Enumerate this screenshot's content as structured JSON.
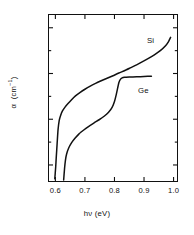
{
  "figure": {
    "width": 194,
    "height": 235,
    "background": "#ffffff",
    "ink_color": "#111111"
  },
  "chart_data": {
    "type": "line",
    "title": "",
    "subtitle": "",
    "xlabel": "hν (eV)",
    "ylabel": "α  (cm⁻¹)",
    "xscale": "linear",
    "yscale": "log",
    "xlim": [
      0.575,
      1.015
    ],
    "ylim": [
      0.18,
      4000000
    ],
    "grid": false,
    "legend_position": "inline-annotations",
    "xticks": [
      0.6,
      0.7,
      0.8,
      0.9,
      1.0
    ],
    "xticklabels": [
      "0.6",
      "0.7",
      "0.8",
      "0.9",
      "1.0"
    ],
    "yticks": [
      1,
      100,
      10000,
      1000000
    ],
    "yticklabels": [
      "1.0",
      "10²",
      "10⁴",
      "10⁶"
    ],
    "ytick_label_parts": [
      {
        "mantissa": "1.0",
        "exponent": ""
      },
      {
        "mantissa": "10",
        "exponent": "2"
      },
      {
        "mantissa": "10",
        "exponent": "4"
      },
      {
        "mantissa": "10",
        "exponent": "6"
      }
    ],
    "yminorticks": [
      10,
      1000,
      100000
    ],
    "series": [
      {
        "name": "Si",
        "label": "Si",
        "color": "#111111",
        "points": [
          [
            0.598,
            0.25
          ],
          [
            0.601,
            0.8
          ],
          [
            0.603,
            2.2
          ],
          [
            0.606,
            9
          ],
          [
            0.609,
            35
          ],
          [
            0.613,
            90
          ],
          [
            0.618,
            150
          ],
          [
            0.624,
            230
          ],
          [
            0.632,
            330
          ],
          [
            0.642,
            470
          ],
          [
            0.654,
            700
          ],
          [
            0.668,
            1050
          ],
          [
            0.684,
            1500
          ],
          [
            0.7,
            2050
          ],
          [
            0.718,
            2800
          ],
          [
            0.736,
            3700
          ],
          [
            0.755,
            4800
          ],
          [
            0.775,
            6200
          ],
          [
            0.795,
            8000
          ],
          [
            0.815,
            10500
          ],
          [
            0.835,
            13500
          ],
          [
            0.855,
            18000
          ],
          [
            0.875,
            24000
          ],
          [
            0.895,
            33000
          ],
          [
            0.915,
            46000
          ],
          [
            0.935,
            66000
          ],
          [
            0.955,
            100000
          ],
          [
            0.972,
            160000
          ],
          [
            0.983,
            250000
          ],
          [
            0.99,
            380000
          ]
        ]
      },
      {
        "name": "Ge",
        "label": "Ge",
        "color": "#111111",
        "points": [
          [
            0.628,
            0.22
          ],
          [
            0.631,
            0.7
          ],
          [
            0.634,
            1.6
          ],
          [
            0.638,
            3.0
          ],
          [
            0.645,
            5.5
          ],
          [
            0.655,
            9.5
          ],
          [
            0.667,
            15
          ],
          [
            0.68,
            23
          ],
          [
            0.695,
            33
          ],
          [
            0.712,
            48
          ],
          [
            0.73,
            68
          ],
          [
            0.748,
            95
          ],
          [
            0.765,
            135
          ],
          [
            0.78,
            200
          ],
          [
            0.792,
            330
          ],
          [
            0.8,
            600
          ],
          [
            0.806,
            1200
          ],
          [
            0.811,
            2400
          ],
          [
            0.815,
            4000
          ],
          [
            0.82,
            5500
          ],
          [
            0.826,
            6400
          ],
          [
            0.834,
            6800
          ],
          [
            0.85,
            7000
          ],
          [
            0.875,
            7200
          ],
          [
            0.9,
            7400
          ],
          [
            0.925,
            7600
          ]
        ]
      }
    ],
    "annotations": [
      {
        "text": "Si",
        "x": 0.93,
        "y": 260000
      },
      {
        "text": "Ge",
        "x": 0.9,
        "y": 1700
      }
    ]
  }
}
